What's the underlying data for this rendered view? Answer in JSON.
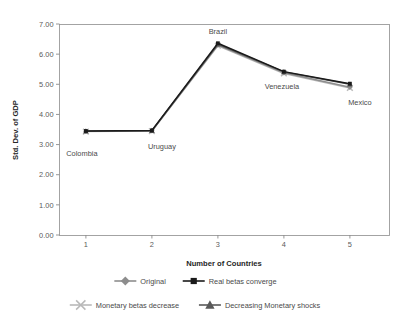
{
  "chart_data": {
    "type": "line",
    "title": "",
    "xlabel": "Number of Countries",
    "ylabel": "Std. Dev. of GDP",
    "x": [
      1,
      2,
      3,
      4,
      5
    ],
    "categories": [
      "1",
      "2",
      "3",
      "4",
      "5"
    ],
    "xtick_labels": [
      "1",
      "2",
      "3",
      "4",
      "5"
    ],
    "ytick_labels": [
      "0.00",
      "1.00",
      "2.00",
      "3.00",
      "4.00",
      "5.00",
      "6.00",
      "7.00"
    ],
    "ytick_values": [
      0,
      1,
      2,
      3,
      4,
      5,
      6,
      7
    ],
    "ylim": [
      0,
      7
    ],
    "xlim": [
      0.6,
      5.6
    ],
    "grid": false,
    "legend_position": "below-axis",
    "point_annotations": [
      {
        "label": "Colombia",
        "x": 1,
        "y": 3.47
      },
      {
        "label": "Uruguay",
        "x": 2,
        "y": 3.45
      },
      {
        "label": "Brazil",
        "x": 3,
        "y": 6.36
      },
      {
        "label": "Venezuela",
        "x": 4,
        "y": 5.4
      },
      {
        "label": "Mexico",
        "x": 5,
        "y": 5.02
      }
    ],
    "series": [
      {
        "name": "Original",
        "marker": "diamond",
        "color": "#8d8d8d",
        "values": [
          3.44,
          3.46,
          6.3,
          5.38,
          4.9
        ]
      },
      {
        "name": "Real betas converge",
        "marker": "square",
        "color": "#1a1a1a",
        "values": [
          3.45,
          3.47,
          6.36,
          5.42,
          5.02
        ]
      },
      {
        "name": "Monetary betas decrease",
        "marker": "x",
        "color": "#b9b9b9",
        "values": [
          3.43,
          3.45,
          6.28,
          5.36,
          4.88
        ]
      },
      {
        "name": "Decreasing Monetary shocks",
        "marker": "triangle",
        "color": "#595959",
        "values": [
          3.44,
          3.46,
          6.33,
          5.41,
          5.0
        ]
      }
    ]
  },
  "legend": {
    "items": [
      {
        "label": "Original",
        "marker": "diamond",
        "color": "#8d8d8d"
      },
      {
        "label": "Real betas converge",
        "marker": "square",
        "color": "#1a1a1a"
      },
      {
        "label": "Monetary betas decrease",
        "marker": "x",
        "color": "#b9b9b9"
      },
      {
        "label": "Decreasing Monetary shocks",
        "marker": "triangle",
        "color": "#595959"
      }
    ]
  }
}
